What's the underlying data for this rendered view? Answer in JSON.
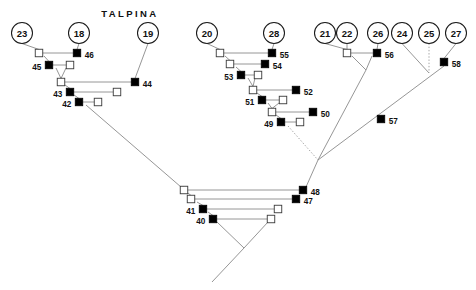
{
  "title": {
    "text": "TALPINA",
    "x": 130,
    "y": 17
  },
  "colors": {
    "background": "#ffffff",
    "edge": "#8a8a8a",
    "edge_dark": "#555555",
    "node_filled": "#000000",
    "node_open_fill": "#ffffff",
    "node_outline": "#1a1a1a",
    "text": "#111111"
  },
  "founders": [
    {
      "label": "23",
      "cx": 22,
      "cy": 33,
      "r": 10.5
    },
    {
      "label": "18",
      "cx": 79,
      "cy": 33,
      "r": 10.5
    },
    {
      "label": "19",
      "cx": 148,
      "cy": 33,
      "r": 10.5
    },
    {
      "label": "20",
      "cx": 207,
      "cy": 33,
      "r": 10.5
    },
    {
      "label": "28",
      "cx": 274,
      "cy": 33,
      "r": 10.5
    },
    {
      "label": "21",
      "cx": 325,
      "cy": 33,
      "r": 10.5
    },
    {
      "label": "22",
      "cx": 347,
      "cy": 33,
      "r": 10.5
    },
    {
      "label": "26",
      "cx": 378,
      "cy": 33,
      "r": 10.5
    },
    {
      "label": "24",
      "cx": 402,
      "cy": 33,
      "r": 10.5
    },
    {
      "label": "25",
      "cx": 429,
      "cy": 33,
      "r": 10.5
    },
    {
      "label": "27",
      "cx": 456,
      "cy": 33,
      "r": 10.5
    }
  ],
  "nodes": [
    {
      "label": "",
      "shape": "open",
      "cx": 39,
      "cy": 53,
      "size": 7.5,
      "label_pos": "none"
    },
    {
      "label": "46",
      "shape": "filled",
      "cx": 77,
      "cy": 53,
      "size": 7.5,
      "label_pos": "right"
    },
    {
      "label": "45",
      "shape": "filled",
      "cx": 49,
      "cy": 65,
      "size": 7.5,
      "label_pos": "left"
    },
    {
      "label": "",
      "shape": "open",
      "cx": 70,
      "cy": 65,
      "size": 7.5,
      "label_pos": "none"
    },
    {
      "label": "",
      "shape": "open",
      "cx": 61,
      "cy": 82,
      "size": 7.5,
      "label_pos": "none"
    },
    {
      "label": "44",
      "shape": "filled",
      "cx": 135,
      "cy": 82,
      "size": 7.5,
      "label_pos": "right"
    },
    {
      "label": "43",
      "shape": "filled",
      "cx": 70,
      "cy": 92,
      "size": 7.5,
      "label_pos": "left"
    },
    {
      "label": "",
      "shape": "open",
      "cx": 117,
      "cy": 92,
      "size": 7.5,
      "label_pos": "none"
    },
    {
      "label": "42",
      "shape": "filled",
      "cx": 79,
      "cy": 102,
      "size": 7.5,
      "label_pos": "left"
    },
    {
      "label": "",
      "shape": "open",
      "cx": 98,
      "cy": 102,
      "size": 7.5,
      "label_pos": "none"
    },
    {
      "label": "",
      "shape": "open",
      "cx": 220,
      "cy": 53,
      "size": 7.5,
      "label_pos": "none"
    },
    {
      "label": "55",
      "shape": "filled",
      "cx": 272,
      "cy": 53,
      "size": 7.5,
      "label_pos": "right"
    },
    {
      "label": "",
      "shape": "open",
      "cx": 230,
      "cy": 64,
      "size": 7.5,
      "label_pos": "none"
    },
    {
      "label": "54",
      "shape": "filled",
      "cx": 265,
      "cy": 64,
      "size": 7.5,
      "label_pos": "right"
    },
    {
      "label": "53",
      "shape": "filled",
      "cx": 241,
      "cy": 75,
      "size": 7.5,
      "label_pos": "left"
    },
    {
      "label": "",
      "shape": "open",
      "cx": 258,
      "cy": 75,
      "size": 7.5,
      "label_pos": "none"
    },
    {
      "label": "",
      "shape": "open",
      "cx": 253,
      "cy": 90,
      "size": 7.5,
      "label_pos": "none"
    },
    {
      "label": "52",
      "shape": "filled",
      "cx": 296,
      "cy": 90,
      "size": 7.5,
      "label_pos": "right"
    },
    {
      "label": "51",
      "shape": "filled",
      "cx": 262,
      "cy": 100,
      "size": 7.5,
      "label_pos": "left"
    },
    {
      "label": "",
      "shape": "open",
      "cx": 283,
      "cy": 100,
      "size": 7.5,
      "label_pos": "none"
    },
    {
      "label": "",
      "shape": "open",
      "cx": 272,
      "cy": 112,
      "size": 7.5,
      "label_pos": "none"
    },
    {
      "label": "50",
      "shape": "filled",
      "cx": 313,
      "cy": 112,
      "size": 7.5,
      "label_pos": "right"
    },
    {
      "label": "49",
      "shape": "filled",
      "cx": 281,
      "cy": 122,
      "size": 7.5,
      "label_pos": "left"
    },
    {
      "label": "",
      "shape": "open",
      "cx": 300,
      "cy": 122,
      "size": 7.5,
      "label_pos": "none"
    },
    {
      "label": "",
      "shape": "open",
      "cx": 347,
      "cy": 53,
      "size": 7.5,
      "label_pos": "none"
    },
    {
      "label": "56",
      "shape": "filled",
      "cx": 377,
      "cy": 53,
      "size": 7.5,
      "label_pos": "right"
    },
    {
      "label": "58",
      "shape": "filled",
      "cx": 444,
      "cy": 62,
      "size": 7.5,
      "label_pos": "right"
    },
    {
      "label": "57",
      "shape": "filled",
      "cx": 381,
      "cy": 119,
      "size": 7.5,
      "label_pos": "right"
    },
    {
      "label": "",
      "shape": "open",
      "cx": 184,
      "cy": 190,
      "size": 7.5,
      "label_pos": "none"
    },
    {
      "label": "48",
      "shape": "filled",
      "cx": 303,
      "cy": 190,
      "size": 7.5,
      "label_pos": "right"
    },
    {
      "label": "",
      "shape": "open",
      "cx": 191,
      "cy": 199,
      "size": 7.5,
      "label_pos": "none"
    },
    {
      "label": "47",
      "shape": "filled",
      "cx": 296,
      "cy": 199,
      "size": 7.5,
      "label_pos": "right"
    },
    {
      "label": "41",
      "shape": "filled",
      "cx": 203,
      "cy": 209,
      "size": 7.5,
      "label_pos": "left"
    },
    {
      "label": "",
      "shape": "open",
      "cx": 278,
      "cy": 209,
      "size": 7.5,
      "label_pos": "none"
    },
    {
      "label": "40",
      "shape": "filled",
      "cx": 213,
      "cy": 219,
      "size": 7.5,
      "label_pos": "left"
    },
    {
      "label": "",
      "shape": "open",
      "cx": 271,
      "cy": 219,
      "size": 7.5,
      "label_pos": "none"
    }
  ],
  "edges": [
    {
      "kind": "solid",
      "points": "22,43.5 39,49.5"
    },
    {
      "kind": "solid",
      "points": "79,43.5 77,49.5"
    },
    {
      "kind": "solid",
      "points": "39,53 77,53"
    },
    {
      "kind": "solid",
      "points": "44,56 49,61.5"
    },
    {
      "kind": "solid",
      "points": "49,65 70,65"
    },
    {
      "kind": "solid",
      "points": "56,68 61,78.5"
    },
    {
      "kind": "solid",
      "points": "66,68 61,78.5"
    },
    {
      "kind": "solid",
      "points": "148,43.5 135,78.5"
    },
    {
      "kind": "solid",
      "points": "61,82 135,82"
    },
    {
      "kind": "solid",
      "points": "65,85 70,88.5"
    },
    {
      "kind": "solid",
      "points": "70,92 117,92"
    },
    {
      "kind": "solid",
      "points": "74,95 79,98.5"
    },
    {
      "kind": "solid",
      "points": "79,102 98,102"
    },
    {
      "kind": "solid",
      "points": "86,105 181,187"
    },
    {
      "kind": "solid",
      "points": "207,43.5 220,49.5"
    },
    {
      "kind": "solid",
      "points": "274,43.5 272,49.5"
    },
    {
      "kind": "solid",
      "points": "220,53 272,53"
    },
    {
      "kind": "solid",
      "points": "225,56 230,60.5"
    },
    {
      "kind": "solid",
      "points": "230,64 265,64"
    },
    {
      "kind": "solid",
      "points": "236,67 241,71.5"
    },
    {
      "kind": "solid",
      "points": "241,75 258,75"
    },
    {
      "kind": "solid",
      "points": "248,78 253,86.5"
    },
    {
      "kind": "solid",
      "points": "255,78 253,86.5"
    },
    {
      "kind": "solid",
      "points": "253,90 296,90"
    },
    {
      "kind": "solid",
      "points": "257,93 262,96.5"
    },
    {
      "kind": "solid",
      "points": "262,100 283,100"
    },
    {
      "kind": "solid",
      "points": "268,103 272,108.5"
    },
    {
      "kind": "solid",
      "points": "279,103 272,108.5"
    },
    {
      "kind": "solid",
      "points": "272,112 313,112"
    },
    {
      "kind": "solid",
      "points": "276,115 281,118.5"
    },
    {
      "kind": "solid",
      "points": "281,122 300,122"
    },
    {
      "kind": "dotted",
      "points": "288,126 318,160"
    },
    {
      "kind": "solid",
      "points": "325,43.5 347,49.5"
    },
    {
      "kind": "solid",
      "points": "347,43.5 347,49.5"
    },
    {
      "kind": "solid",
      "points": "378,43.5 377,49.5"
    },
    {
      "kind": "solid",
      "points": "347,53 377,53"
    },
    {
      "kind": "solid",
      "points": "352,56 366,70"
    },
    {
      "kind": "solid",
      "points": "372,56 366,70"
    },
    {
      "kind": "solid",
      "points": "366,70 318,160"
    },
    {
      "kind": "solid",
      "points": "402,43.5 429,73"
    },
    {
      "kind": "dotted",
      "points": "429,43.5 429,73"
    },
    {
      "kind": "solid",
      "points": "456,43.5 444,58.5"
    },
    {
      "kind": "solid",
      "points": "444,66 318,160"
    },
    {
      "kind": "solid",
      "points": "318,160 306,187"
    },
    {
      "kind": "solid",
      "points": "181,187 184,186.5"
    },
    {
      "kind": "solid",
      "points": "184,190 303,190"
    },
    {
      "kind": "solid",
      "points": "188,193 191,195.5"
    },
    {
      "kind": "solid",
      "points": "191,199 296,199"
    },
    {
      "kind": "solid",
      "points": "197,202 203,205.5"
    },
    {
      "kind": "solid",
      "points": "203,209 278,209"
    },
    {
      "kind": "solid",
      "points": "208,212 213,215.5"
    },
    {
      "kind": "solid",
      "points": "213,219 271,219"
    },
    {
      "kind": "solid",
      "points": "217,222 244,248"
    },
    {
      "kind": "solid",
      "points": "268,222 244,248"
    },
    {
      "kind": "solid",
      "points": "244,248 212,282"
    }
  ],
  "legend": {
    "filled_meaning": "affected individual",
    "open_meaning": "unaffected individual",
    "circle_meaning": "founder"
  }
}
